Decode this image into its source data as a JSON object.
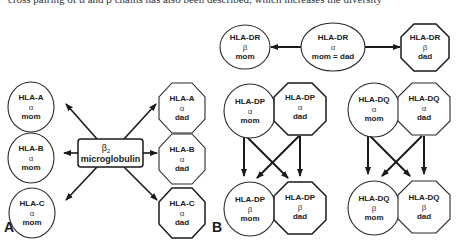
{
  "caption_fragment": "cross pairing of α and β chains has also been described, which increases the diversity",
  "panel_a": {
    "label": "A",
    "center": {
      "line1": "β",
      "subscript": "2",
      "line2": "microglobulin"
    },
    "mom_nodes": [
      {
        "gene": "HLA-A",
        "chain": "α",
        "parent": "mom"
      },
      {
        "gene": "HLA-B",
        "chain": "α",
        "parent": "mom"
      },
      {
        "gene": "HLA-C",
        "chain": "α",
        "parent": "mom"
      }
    ],
    "dad_nodes": [
      {
        "gene": "HLA-A",
        "chain": "α",
        "parent": "dad"
      },
      {
        "gene": "HLA-B",
        "chain": "α",
        "parent": "dad"
      },
      {
        "gene": "HLA-C",
        "chain": "α",
        "parent": "dad"
      }
    ]
  },
  "panel_b": {
    "label": "B",
    "dr": {
      "beta_mom": {
        "gene": "HLA-DR",
        "chain": "β",
        "parent": "mom"
      },
      "alpha_shared": {
        "gene": "HLA-DR",
        "chain": "α",
        "parent": "mom = dad"
      },
      "beta_dad": {
        "gene": "HLA-DR",
        "chain": "β",
        "parent": "dad"
      }
    },
    "dp": {
      "alpha_mom": {
        "gene": "HLA-DP",
        "chain": "α",
        "parent": "mom"
      },
      "alpha_dad": {
        "gene": "HLA-DP",
        "chain": "α",
        "parent": "dad"
      },
      "beta_mom": {
        "gene": "HLA-DP",
        "chain": "β",
        "parent": "mom"
      },
      "beta_dad": {
        "gene": "HLA-DP",
        "chain": "β",
        "parent": "dad"
      }
    },
    "dq": {
      "alpha_mom": {
        "gene": "HLA-DQ",
        "chain": "α",
        "parent": "mom"
      },
      "alpha_dad": {
        "gene": "HLA-DQ",
        "chain": "α",
        "parent": "dad"
      },
      "beta_mom": {
        "gene": "HLA-DQ",
        "chain": "β",
        "parent": "mom"
      },
      "beta_dad": {
        "gene": "HLA-DQ",
        "chain": "β",
        "parent": "dad"
      }
    }
  },
  "legend_semantics": {
    "mom_shape": "circle",
    "dad_shape": "octagon"
  },
  "colors": {
    "stroke": "#1a1a1a",
    "background": "#ffffff"
  }
}
